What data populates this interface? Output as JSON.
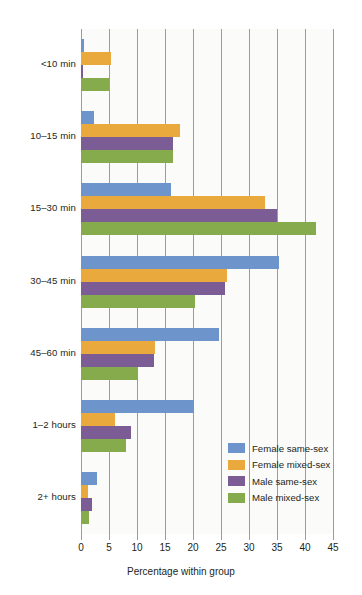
{
  "chart_data": {
    "type": "bar",
    "orientation": "horizontal-grouped",
    "title": "",
    "xlabel": "Percentage within group",
    "ylabel": "",
    "xlim": [
      0,
      45
    ],
    "xticks": [
      0,
      5,
      10,
      15,
      20,
      25,
      30,
      35,
      40,
      45
    ],
    "xtick_labels": [
      "0",
      "5",
      "10",
      "15",
      "20",
      "25",
      "30",
      "35",
      "40",
      "45"
    ],
    "grid": "vertical",
    "legend_position": "lower-right",
    "categories": [
      "<10 min",
      "10–15 min",
      "15–30 min",
      "30–45 min",
      "45–60 min",
      "1–2 hours",
      "2+ hours"
    ],
    "series": [
      {
        "name": "Female same-sex",
        "color": "#6d95cb",
        "values": [
          0.5,
          2.3,
          16.1,
          35.4,
          24.6,
          20.2,
          2.9
        ]
      },
      {
        "name": "Female mixed-sex",
        "color": "#e9a93c",
        "values": [
          5.4,
          17.7,
          32.9,
          26.0,
          13.2,
          6.1,
          1.2
        ]
      },
      {
        "name": "Male same-sex",
        "color": "#7c5c95",
        "values": [
          0.3,
          16.4,
          35.0,
          25.7,
          13.0,
          9.0,
          2.0
        ]
      },
      {
        "name": "Male mixed-sex",
        "color": "#85ab4d",
        "values": [
          5.0,
          16.4,
          41.9,
          20.4,
          10.1,
          8.0,
          1.4
        ]
      }
    ]
  },
  "legend": {
    "items": [
      {
        "label": "Female same-sex"
      },
      {
        "label": "Female mixed-sex"
      },
      {
        "label": "Male same-sex"
      },
      {
        "label": "Male mixed-sex"
      }
    ]
  },
  "axis": {
    "x_title": "Percentage within group"
  }
}
